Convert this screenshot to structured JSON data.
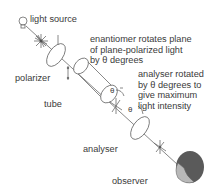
{
  "diagram": {
    "type": "polarimeter",
    "labels": {
      "light_source": "light source",
      "polarizer": "polarizer",
      "tube": "tube",
      "enantiomer_note": "enantiomer rotates plane\nof plane-polarized light\nby θ degrees",
      "analyser_note": "analyser rotated\nby θ degrees to\ngive maximum\nlight intensity",
      "analyser": "analyser",
      "observer": "observer",
      "theta_1": "θ",
      "theta_2": "θ"
    },
    "colors": {
      "line": "#6a6a6a",
      "text": "#3a3a3a",
      "head_dark": "#5a5a5a",
      "face": "#b8b8b8"
    }
  }
}
